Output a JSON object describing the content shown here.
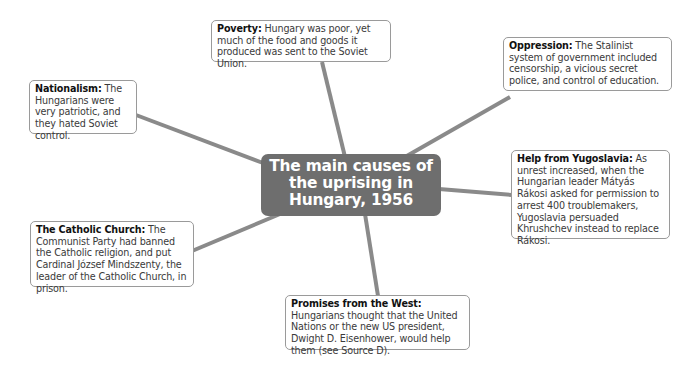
{
  "diagram": {
    "type": "mind-map",
    "colors": {
      "center_fill": "#6e6e6e",
      "center_text": "#ffffff",
      "connector": "#8a8a8a",
      "node_border": "#9a9a9a",
      "node_fill": "#ffffff"
    },
    "center": {
      "lines": [
        "The main causes of",
        "the uprising in",
        "Hungary, 1956"
      ]
    },
    "nodes": [
      {
        "id": "poverty",
        "label": "Poverty:",
        "text": " Hungary was poor, yet much of the food and goods it produced was sent to the Soviet Union."
      },
      {
        "id": "oppression",
        "label": "Oppression:",
        "text": " The Stalinist system of government included censorship, a vicious secret police, and control of education."
      },
      {
        "id": "nationalism",
        "label": "Nationalism:",
        "text": " The Hungarians were very patriotic, and they hated Soviet control."
      },
      {
        "id": "yugoslavia",
        "label": "Help from Yugoslavia:",
        "text": " As unrest increased, when the Hungarian leader Mátyás Rákosi asked for permission to arrest 400 troublemakers, Yugoslavia persuaded Khrushchev instead to replace Rákosi."
      },
      {
        "id": "catholic",
        "label": "The Catholic Church:",
        "text": " The Communist Party had banned the Catholic religion, and put Cardinal József Mindszenty, the leader of the Catholic Church, in prison."
      },
      {
        "id": "west",
        "label": "Promises from the West:",
        "text": " Hungarians thought that the United Nations or the new US president, Dwight D. Eisenhower, would help them (see Source D)."
      }
    ]
  }
}
